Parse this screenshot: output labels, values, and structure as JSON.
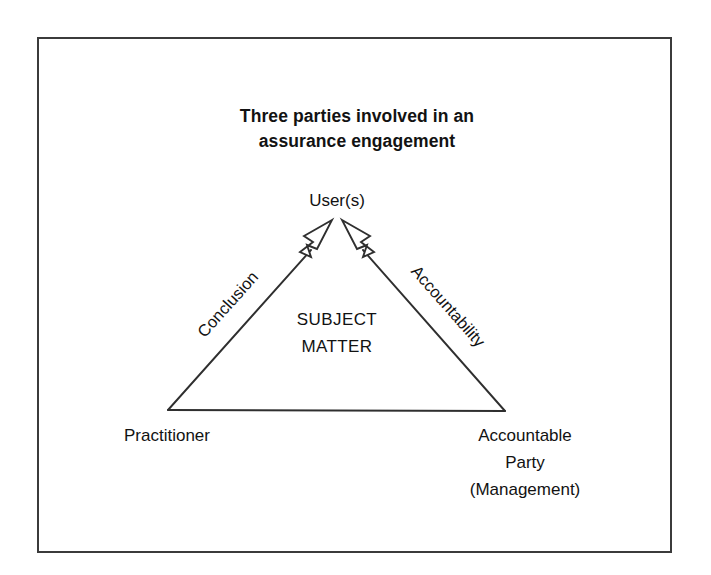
{
  "diagram": {
    "title_line1": "Three parties involved in an",
    "title_line2": "assurance engagement",
    "apex_label": "User(s)",
    "center_label_line1": "SUBJECT",
    "center_label_line2": "MATTER",
    "left_node_label": "Practitioner",
    "right_node_line1": "Accountable",
    "right_node_line2": "Party",
    "right_node_line3": "(Management)",
    "left_edge_label": "Conclusion",
    "right_edge_label": "Accountability",
    "colors": {
      "background": "#ffffff",
      "border": "#3b3b3b",
      "stroke": "#2f2f2f",
      "text": "#121212"
    },
    "shape": {
      "type": "triangle",
      "apex": [
        337,
        222
      ],
      "bottom_left": [
        168,
        410
      ],
      "bottom_right": [
        505,
        411
      ],
      "arrowheads": 2,
      "arrowhead_style": "open-outline"
    }
  }
}
